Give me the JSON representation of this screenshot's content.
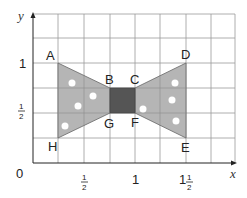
{
  "diagram": {
    "type": "coordinate-grid-bowtie",
    "axes": {
      "x_label": "x",
      "y_label": "y",
      "origin_label": "0"
    },
    "x_ticks": [
      {
        "whole": "",
        "num": "1",
        "den": "2"
      },
      {
        "whole": "1",
        "num": "",
        "den": ""
      },
      {
        "whole": "1",
        "num": "1",
        "den": "2"
      }
    ],
    "y_ticks": [
      {
        "whole": "1",
        "num": "",
        "den": ""
      },
      {
        "whole": "",
        "num": "1",
        "den": "2"
      }
    ],
    "points": {
      "A": "A",
      "B": "B",
      "C": "C",
      "D": "D",
      "E": "E",
      "F": "F",
      "G": "G",
      "H": "H"
    },
    "colors": {
      "grid": "#888888",
      "wing_fill": "#b5b5b5",
      "center_fill": "#555555",
      "dots": "#ffffff"
    }
  }
}
